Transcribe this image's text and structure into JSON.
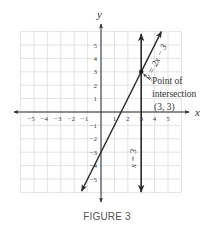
{
  "figure": {
    "caption": "FIGURE 3",
    "x_axis_label": "x",
    "y_axis_label": "y",
    "x_tick_labels": [
      {
        "value": -5,
        "label": "−5"
      },
      {
        "value": -4,
        "label": "−4"
      },
      {
        "value": -3,
        "label": "−3"
      },
      {
        "value": -2,
        "label": "−2"
      },
      {
        "value": -1,
        "label": "−1"
      },
      {
        "value": 1,
        "label": "1"
      },
      {
        "value": 2,
        "label": "2"
      },
      {
        "value": 3,
        "label": "3"
      },
      {
        "value": 4,
        "label": "4"
      },
      {
        "value": 5,
        "label": "5"
      }
    ],
    "y_tick_labels": [
      {
        "value": 5,
        "label": "5"
      },
      {
        "value": 4,
        "label": "4"
      },
      {
        "value": 3,
        "label": "3"
      },
      {
        "value": 2,
        "label": "2"
      },
      {
        "value": 1,
        "label": "1"
      },
      {
        "value": -1,
        "label": "−1"
      },
      {
        "value": -2,
        "label": "−2"
      },
      {
        "value": -3,
        "label": "−3"
      },
      {
        "value": -4,
        "label": "−4"
      },
      {
        "value": -5,
        "label": "−5"
      }
    ],
    "lines": [
      {
        "name": "line-y-equals-2x-minus-3",
        "label": "y = 2x − 3",
        "equation": "y = 2x - 3",
        "slope": 2,
        "intercept": -3
      },
      {
        "name": "line-x-equals-3",
        "label": "x = 3",
        "equation": "x = 3",
        "vertical_x": 3
      }
    ],
    "annotation": {
      "line1": "Point of",
      "line2": "intersection",
      "line3": "(3, 3)",
      "point": {
        "x": 3,
        "y": 3
      }
    },
    "colors": {
      "line": "#2b2b2b",
      "grid": "#dcdcdc",
      "text": "#333333"
    }
  },
  "chart_data": {
    "type": "line",
    "title": "FIGURE 3",
    "xlabel": "x",
    "ylabel": "y",
    "xlim": [
      -6,
      6
    ],
    "ylim": [
      -6,
      6
    ],
    "grid": true,
    "x_ticks": [
      -5,
      -4,
      -3,
      -2,
      -1,
      1,
      2,
      3,
      4,
      5
    ],
    "y_ticks": [
      -5,
      -4,
      -3,
      -2,
      -1,
      1,
      2,
      3,
      4,
      5
    ],
    "series": [
      {
        "name": "y = 2x − 3",
        "x": [
          -1.45,
          4.5
        ],
        "y": [
          -5.9,
          6.0
        ]
      },
      {
        "name": "x = 3",
        "x": [
          3,
          3
        ],
        "y": [
          -6.0,
          5.8
        ]
      }
    ],
    "annotations": [
      {
        "text": "Point of intersection (3, 3)",
        "x": 3,
        "y": 3
      }
    ]
  }
}
